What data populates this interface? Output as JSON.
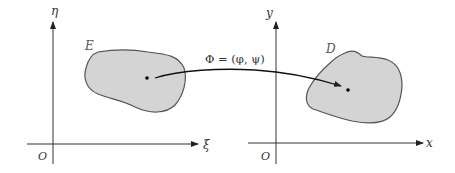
{
  "left_plane": {
    "vertical_axis_label": "η",
    "horizontal_axis_label": "ξ",
    "origin_label": "O",
    "region_label": "E"
  },
  "right_plane": {
    "vertical_axis_label": "y",
    "horizontal_axis_label": "x",
    "origin_label": "O",
    "region_label": "D"
  },
  "mapping": {
    "label": "Φ = (φ, ψ)"
  },
  "colors": {
    "region_fill": "#d4d4d4",
    "region_stroke": "#555555",
    "axis": "#333333",
    "arrow": "#111111"
  }
}
